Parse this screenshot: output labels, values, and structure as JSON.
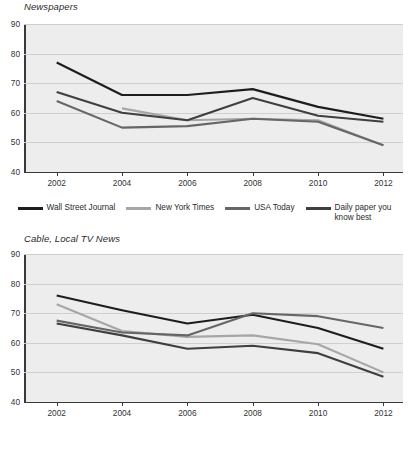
{
  "charts": [
    {
      "id": "newspapers",
      "title": "Newspapers",
      "x_ticks": [
        "2002",
        "2004",
        "2006",
        "2008",
        "2010",
        "2012"
      ],
      "y_ticks": [
        "90",
        "80",
        "70",
        "60",
        "50",
        "40"
      ],
      "legend": [
        {
          "label": "Wall Street Journal",
          "color": "#1d1d1d"
        },
        {
          "label": "New York Times",
          "color": "#a6a6a6"
        },
        {
          "label": "USA Today",
          "color": "#666666"
        },
        {
          "label": "Daily paper you\nknow best",
          "color": "#3f3f3f"
        }
      ]
    },
    {
      "id": "cable",
      "title": "Cable, Local TV News",
      "x_ticks": [
        "2002",
        "2004",
        "2006",
        "2008",
        "2010",
        "2012"
      ],
      "y_ticks": [
        "90",
        "80",
        "70",
        "60",
        "50",
        "40"
      ],
      "legend": [
        {
          "label": "CNN",
          "color": "#1d1d1d"
        },
        {
          "label": "MSNBC",
          "color": "#a6a6a6"
        },
        {
          "label": "Fox News",
          "color": "#666666"
        },
        {
          "label": "Local TV news",
          "color": "#3f3f3f"
        }
      ]
    }
  ],
  "chart_data": [
    {
      "type": "line",
      "title": "Newspapers",
      "xlabel": "",
      "ylabel": "",
      "x": [
        2002,
        2004,
        2006,
        2008,
        2010,
        2012
      ],
      "xlim": [
        2001,
        2012.6
      ],
      "ylim": [
        40,
        90
      ],
      "yticks": [
        40,
        50,
        60,
        70,
        80,
        90
      ],
      "grid": true,
      "legend_position": "bottom",
      "series": [
        {
          "name": "Wall Street Journal",
          "color": "#1d1d1d",
          "x": [
            2002,
            2004,
            2006,
            2008,
            2010,
            2012
          ],
          "values": [
            77,
            66,
            66,
            68,
            62,
            58
          ]
        },
        {
          "name": "New York Times",
          "color": "#a6a6a6",
          "x": [
            2004,
            2006,
            2008,
            2010,
            2012
          ],
          "values": [
            61.5,
            57.5,
            58,
            57.5,
            49
          ]
        },
        {
          "name": "USA Today",
          "color": "#666666",
          "x": [
            2002,
            2004,
            2006,
            2008,
            2010,
            2012
          ],
          "values": [
            64,
            55,
            55.5,
            58,
            57,
            49
          ]
        },
        {
          "name": "Daily paper you know best",
          "color": "#3f3f3f",
          "x": [
            2002,
            2004,
            2006,
            2008,
            2010,
            2012
          ],
          "values": [
            67,
            60,
            57.5,
            65,
            59,
            57
          ]
        }
      ]
    },
    {
      "type": "line",
      "title": "Cable, Local TV News",
      "xlabel": "",
      "ylabel": "",
      "x": [
        2002,
        2004,
        2006,
        2008,
        2010,
        2012
      ],
      "xlim": [
        2001,
        2012.6
      ],
      "ylim": [
        40,
        90
      ],
      "yticks": [
        40,
        50,
        60,
        70,
        80,
        90
      ],
      "grid": true,
      "legend_position": "bottom",
      "series": [
        {
          "name": "CNN",
          "color": "#1d1d1d",
          "x": [
            2002,
            2004,
            2006,
            2008,
            2010,
            2012
          ],
          "values": [
            76,
            71,
            66.5,
            69.5,
            65,
            58
          ]
        },
        {
          "name": "MSNBC",
          "color": "#a6a6a6",
          "x": [
            2002,
            2004,
            2006,
            2008,
            2010,
            2012
          ],
          "values": [
            73,
            64,
            62,
            62.5,
            59.5,
            50
          ]
        },
        {
          "name": "Fox News",
          "color": "#666666",
          "x": [
            2002,
            2004,
            2006,
            2008,
            2010,
            2012
          ],
          "values": [
            67.5,
            63.5,
            62.5,
            70,
            69,
            65
          ]
        },
        {
          "name": "Local TV news",
          "color": "#3f3f3f",
          "x": [
            2002,
            2004,
            2006,
            2008,
            2010,
            2012
          ],
          "values": [
            66.5,
            62.5,
            58,
            59,
            56.5,
            48.5
          ]
        }
      ]
    }
  ]
}
